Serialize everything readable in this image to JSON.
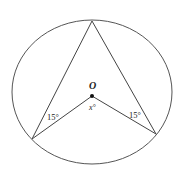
{
  "diagram": {
    "type": "circle-geometry",
    "circle": {
      "cx": 92,
      "cy": 92,
      "rx": 80,
      "ry": 72,
      "stroke": "#555555"
    },
    "center_label": "O",
    "points": {
      "top": {
        "x": 92,
        "y": 21
      },
      "center": {
        "x": 92,
        "y": 96
      },
      "bottom_left": {
        "x": 32,
        "y": 139
      },
      "bottom_right": {
        "x": 156,
        "y": 134
      }
    },
    "labels": {
      "center": "O",
      "center_angle": "x°",
      "left_angle": "15°",
      "right_angle": "15°"
    },
    "line_color": "#444444"
  }
}
